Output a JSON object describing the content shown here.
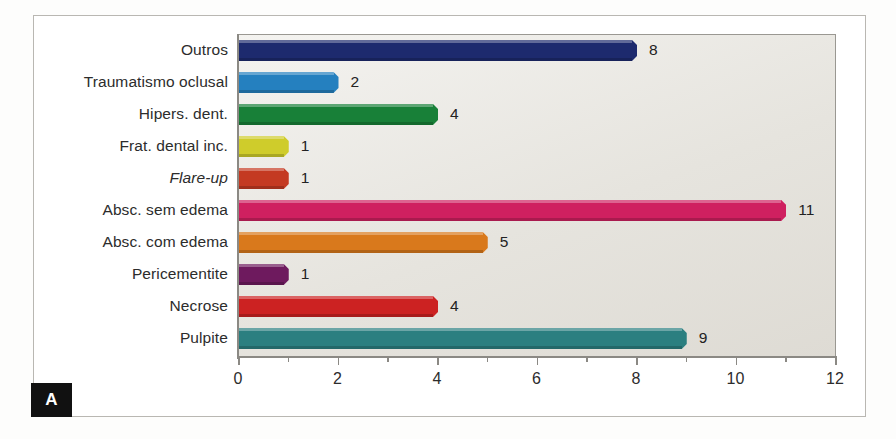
{
  "figure": {
    "panel_label": "A"
  },
  "chart_data": {
    "type": "bar",
    "orientation": "horizontal",
    "title": "",
    "xlabel": "",
    "ylabel": "",
    "xlim": [
      0,
      12
    ],
    "xticks": [
      0,
      2,
      4,
      6,
      8,
      10,
      12
    ],
    "xtick_labels": [
      "0",
      "2",
      "4",
      "6",
      "8",
      "10",
      "12"
    ],
    "minor_tick_interval": 1,
    "grid": false,
    "legend": "none",
    "value_labels": true,
    "categories": [
      "Outros",
      "Traumatismo oclusal",
      "Hipers. dent.",
      "Frat. dental inc.",
      "Flare-up",
      "Absc. sem edema",
      "Absc. com edema",
      "Pericementite",
      "Necrose",
      "Pulpite"
    ],
    "values": [
      8,
      2,
      4,
      1,
      1,
      11,
      5,
      1,
      4,
      9
    ],
    "value_label_text": [
      "8",
      "2",
      "4",
      "1",
      "1",
      "11",
      "5",
      "1",
      "4",
      "9"
    ],
    "colors": [
      "#1d2a6e",
      "#2580bf",
      "#188038",
      "#cfcc2b",
      "#c43a22",
      "#cf2060",
      "#d9791c",
      "#6e1a5e",
      "#cc2222",
      "#2b7f80"
    ],
    "italic_categories": [
      "Flare-up"
    ],
    "plot_background": "#e6e4de",
    "axis_color": "#8b8984"
  }
}
